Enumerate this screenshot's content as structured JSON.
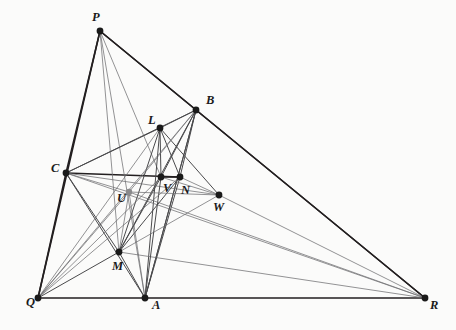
{
  "figure": {
    "background_color": "#fbfbfa",
    "width": 456,
    "height": 330
  },
  "style": {
    "line_color_dark": "#231f20",
    "line_color_mid": "#4a4a4c",
    "line_color_light": "#6f6f72",
    "vertex_fill": "#1a1a1a",
    "vertex_fill_light": "#8a8a8c",
    "label_color": "#1a1a1a"
  },
  "points": [
    {
      "id": "P",
      "label": "P",
      "x": 100,
      "y": 31,
      "r": 3.4,
      "shade": "dark",
      "lx": 92,
      "ly": 21
    },
    {
      "id": "B",
      "label": "B",
      "x": 196,
      "y": 110,
      "r": 3.4,
      "shade": "dark",
      "lx": 206,
      "ly": 104
    },
    {
      "id": "L",
      "label": "L",
      "x": 160,
      "y": 128,
      "r": 3.4,
      "shade": "dark",
      "lx": 148,
      "ly": 124
    },
    {
      "id": "C",
      "label": "C",
      "x": 66,
      "y": 173,
      "r": 3.4,
      "shade": "dark",
      "lx": 51,
      "ly": 172
    },
    {
      "id": "V",
      "label": "V",
      "x": 161,
      "y": 177,
      "r": 3.4,
      "shade": "dark",
      "lx": 163,
      "ly": 192
    },
    {
      "id": "N",
      "label": "N",
      "x": 180,
      "y": 177,
      "r": 3.4,
      "shade": "dark",
      "lx": 181,
      "ly": 194
    },
    {
      "id": "U",
      "label": "U",
      "x": 129,
      "y": 192,
      "r": 3.2,
      "shade": "light",
      "lx": 117,
      "ly": 202
    },
    {
      "id": "W",
      "label": "W",
      "x": 219,
      "y": 195,
      "r": 3.4,
      "shade": "dark",
      "lx": 213,
      "ly": 211
    },
    {
      "id": "M",
      "label": "M",
      "x": 119,
      "y": 252,
      "r": 3.4,
      "shade": "dark",
      "lx": 112,
      "ly": 270
    },
    {
      "id": "Q",
      "label": "Q",
      "x": 38,
      "y": 298,
      "r": 3.4,
      "shade": "dark",
      "lx": 26,
      "ly": 306
    },
    {
      "id": "A",
      "label": "A",
      "x": 145,
      "y": 298,
      "r": 3.4,
      "shade": "dark",
      "lx": 152,
      "ly": 309
    },
    {
      "id": "R",
      "label": "R",
      "x": 425,
      "y": 298,
      "r": 3.4,
      "shade": "dark",
      "lx": 430,
      "ly": 309
    }
  ],
  "segments": [
    {
      "from": "P",
      "to": "Q",
      "weight": "heavy"
    },
    {
      "from": "P",
      "to": "R",
      "weight": "heavy"
    },
    {
      "from": "Q",
      "to": "R",
      "weight": "heavy"
    },
    {
      "from": "P",
      "to": "C",
      "weight": "heavy"
    },
    {
      "from": "C",
      "to": "Q",
      "weight": "heavy"
    },
    {
      "from": "P",
      "to": "B",
      "weight": "heavy"
    },
    {
      "from": "B",
      "to": "R",
      "weight": "heavy"
    },
    {
      "from": "C",
      "to": "N",
      "weight": "heavy"
    },
    {
      "from": "C",
      "to": "B",
      "weight": "medium"
    },
    {
      "from": "C",
      "to": "A",
      "weight": "medium"
    },
    {
      "from": "A",
      "to": "B",
      "weight": "medium"
    },
    {
      "from": "P",
      "to": "M",
      "weight": "light"
    },
    {
      "from": "P",
      "to": "V",
      "weight": "light"
    },
    {
      "from": "P",
      "to": "A",
      "weight": "light"
    },
    {
      "from": "L",
      "to": "B",
      "weight": "medium"
    },
    {
      "from": "L",
      "to": "C",
      "weight": "medium"
    },
    {
      "from": "L",
      "to": "M",
      "weight": "medium"
    },
    {
      "from": "L",
      "to": "A",
      "weight": "medium"
    },
    {
      "from": "L",
      "to": "V",
      "weight": "medium"
    },
    {
      "from": "L",
      "to": "N",
      "weight": "medium"
    },
    {
      "from": "L",
      "to": "W",
      "weight": "medium"
    },
    {
      "from": "L",
      "to": "Q",
      "weight": "light"
    },
    {
      "from": "B",
      "to": "M",
      "weight": "medium"
    },
    {
      "from": "B",
      "to": "V",
      "weight": "medium"
    },
    {
      "from": "B",
      "to": "N",
      "weight": "medium"
    },
    {
      "from": "B",
      "to": "A",
      "weight": "medium"
    },
    {
      "from": "B",
      "to": "U",
      "weight": "light"
    },
    {
      "from": "B",
      "to": "Q",
      "weight": "light"
    },
    {
      "from": "C",
      "to": "M",
      "weight": "medium"
    },
    {
      "from": "C",
      "to": "U",
      "weight": "light"
    },
    {
      "from": "C",
      "to": "W",
      "weight": "light"
    },
    {
      "from": "C",
      "to": "R",
      "weight": "light"
    },
    {
      "from": "M",
      "to": "V",
      "weight": "medium"
    },
    {
      "from": "M",
      "to": "N",
      "weight": "medium"
    },
    {
      "from": "M",
      "to": "A",
      "weight": "medium"
    },
    {
      "from": "M",
      "to": "Q",
      "weight": "medium"
    },
    {
      "from": "M",
      "to": "U",
      "weight": "light"
    },
    {
      "from": "M",
      "to": "R",
      "weight": "light"
    },
    {
      "from": "M",
      "to": "W",
      "weight": "light"
    },
    {
      "from": "A",
      "to": "V",
      "weight": "medium"
    },
    {
      "from": "A",
      "to": "N",
      "weight": "medium"
    },
    {
      "from": "A",
      "to": "U",
      "weight": "light"
    },
    {
      "from": "Q",
      "to": "V",
      "weight": "light"
    },
    {
      "from": "Q",
      "to": "N",
      "weight": "light"
    },
    {
      "from": "Q",
      "to": "U",
      "weight": "light"
    },
    {
      "from": "U",
      "to": "W",
      "weight": "light"
    },
    {
      "from": "U",
      "to": "R",
      "weight": "light"
    },
    {
      "from": "V",
      "to": "W",
      "weight": "light"
    },
    {
      "from": "N",
      "to": "W",
      "weight": "light"
    },
    {
      "from": "W",
      "to": "R",
      "weight": "light"
    },
    {
      "from": "V",
      "to": "N",
      "weight": "heavy"
    }
  ]
}
